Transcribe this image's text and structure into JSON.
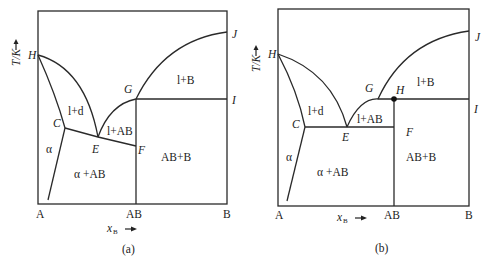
{
  "diagrams": [
    {
      "id": "a",
      "caption": "(a)",
      "y_axis_label": "T/K",
      "x_axis_label": "x",
      "x_axis_subscript": "B",
      "x_ticks": [
        "A",
        "AB",
        "B"
      ],
      "points": {
        "H": "H",
        "C": "C",
        "E": "E",
        "F": "F",
        "G": "G",
        "I": "I",
        "J": "J"
      },
      "regions": {
        "ld": "l+d",
        "lAB": "l+AB",
        "lB": "l+B",
        "alpha": "α",
        "alphaAB": "α +AB",
        "ABB": "AB+B"
      }
    },
    {
      "id": "b",
      "caption": "(b)",
      "y_axis_label": "T/K",
      "x_axis_label": "x",
      "x_axis_subscript": "B",
      "x_ticks": [
        "A",
        "AB",
        "B"
      ],
      "points": {
        "H": "H",
        "C": "C",
        "E": "E",
        "F": "F",
        "G": "G",
        "H2": "H",
        "I": "I",
        "J": "J"
      },
      "regions": {
        "ld": "l+d",
        "lAB": "l+AB",
        "lB": "l+B",
        "alpha": "α",
        "alphaAB": "α +AB",
        "ABB": "AB+B"
      }
    }
  ]
}
